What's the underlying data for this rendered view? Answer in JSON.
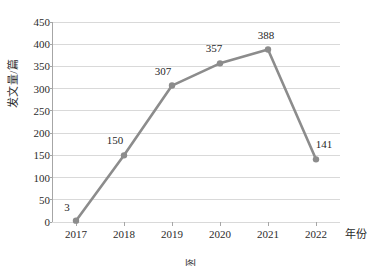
{
  "chart_data": {
    "type": "line",
    "title": "",
    "xlabel": "年份",
    "ylabel": "发文量/篇",
    "categories": [
      "2017",
      "2018",
      "2019",
      "2020",
      "2021",
      "2022"
    ],
    "values": [
      3,
      150,
      307,
      357,
      388,
      141
    ],
    "point_labels": [
      "3",
      "150",
      "307",
      "357",
      "388",
      "141"
    ],
    "ylim": [
      0,
      450
    ],
    "ytick_step": 50,
    "yticks": [
      "450",
      "400",
      "350",
      "300",
      "250",
      "200",
      "150",
      "100",
      "50",
      "0"
    ],
    "ytick_values": [
      450,
      400,
      350,
      300,
      250,
      200,
      150,
      100,
      50,
      0
    ],
    "grid": "horizontal",
    "legend": "none",
    "series": [
      {
        "name": "发文量",
        "values": [
          3,
          150,
          307,
          357,
          388,
          141
        ],
        "color": "#8c8c8c",
        "marker": "circle"
      }
    ],
    "colors": {
      "line": "#8c8c8c",
      "marker": "#8c8c8c",
      "grid": "#d9d9d9",
      "axis": "#a6a6a6",
      "text": "#2b2b2b",
      "background": "#ffffff"
    }
  },
  "caption": {
    "text": "图"
  }
}
